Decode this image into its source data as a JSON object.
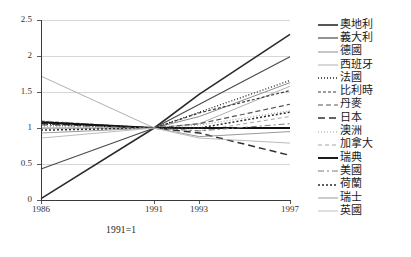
{
  "chart_data": {
    "type": "line",
    "title": "",
    "subtitle": "",
    "xlabel": "",
    "ylabel": "",
    "annotation": "1991=1",
    "grid": true,
    "legend_position": "right",
    "x": [
      1986,
      1991,
      1993,
      1997
    ],
    "xlim": [
      1986,
      1997
    ],
    "ylim": [
      0,
      2.5
    ],
    "xticklabels": [
      "1986",
      "1991",
      "1993",
      "1997"
    ],
    "yticklabels": [
      "0",
      "0.5",
      "1",
      "1.5",
      "2",
      "2.5"
    ],
    "ytickvalues": [
      0,
      0.5,
      1,
      1.5,
      2,
      2.5
    ],
    "series": [
      {
        "name": "奧地利",
        "values": [
          0.02,
          1.0,
          1.47,
          2.3
        ],
        "color": "#2b2b2b",
        "width": 1.6,
        "dash": "none"
      },
      {
        "name": "義大利",
        "values": [
          0.43,
          1.0,
          1.33,
          1.99
        ],
        "color": "#4a4a4a",
        "width": 1.2,
        "dash": "none"
      },
      {
        "name": "德國",
        "values": [
          1.0,
          1.0,
          1.16,
          1.63
        ],
        "color": "#8c8c8c",
        "width": 1.0,
        "dash": "none"
      },
      {
        "name": "西班牙",
        "values": [
          1.72,
          1.0,
          1.06,
          1.58
        ],
        "color": "#b0b0b0",
        "width": 1.0,
        "dash": "none"
      },
      {
        "name": "法國",
        "values": [
          1.05,
          1.0,
          1.22,
          1.66
        ],
        "color": "#1f1f1f",
        "width": 1.3,
        "dash": "1,2"
      },
      {
        "name": "比利時",
        "values": [
          1.09,
          1.0,
          1.21,
          1.52
        ],
        "color": "#3d3d3d",
        "width": 1.2,
        "dash": "3,2"
      },
      {
        "name": "丹麥",
        "values": [
          1.07,
          1.0,
          1.06,
          1.33
        ],
        "color": "#555555",
        "width": 1.2,
        "dash": "5,3"
      },
      {
        "name": "日本",
        "values": [
          1.06,
          1.0,
          0.93,
          0.62
        ],
        "color": "#303030",
        "width": 1.5,
        "dash": "7,4"
      },
      {
        "name": "澳洲",
        "values": [
          1.02,
          1.0,
          1.04,
          1.24
        ],
        "color": "#9c9c9c",
        "width": 1.0,
        "dash": "1,2"
      },
      {
        "name": "加拿大",
        "values": [
          1.1,
          1.0,
          0.96,
          1.16
        ],
        "color": "#a5a5a5",
        "width": 1.0,
        "dash": "4,3"
      },
      {
        "name": "瑞典",
        "values": [
          1.08,
          1.0,
          1.0,
          1.0
        ],
        "color": "#111111",
        "width": 1.9,
        "dash": "none"
      },
      {
        "name": "美國",
        "values": [
          1.04,
          1.0,
          0.96,
          1.06
        ],
        "color": "#7a7a7a",
        "width": 1.0,
        "dash": "6,3,2,3"
      },
      {
        "name": "荷蘭",
        "values": [
          0.97,
          1.0,
          1.0,
          1.22
        ],
        "color": "#2a2a2a",
        "width": 1.5,
        "dash": "2,2"
      },
      {
        "name": "瑞士",
        "values": [
          0.93,
          1.0,
          0.88,
          0.95
        ],
        "color": "#9a9a9a",
        "width": 1.0,
        "dash": "none"
      },
      {
        "name": "英國",
        "values": [
          0.86,
          1.0,
          0.86,
          0.79
        ],
        "color": "#bcbcbc",
        "width": 1.0,
        "dash": "none"
      }
    ]
  }
}
